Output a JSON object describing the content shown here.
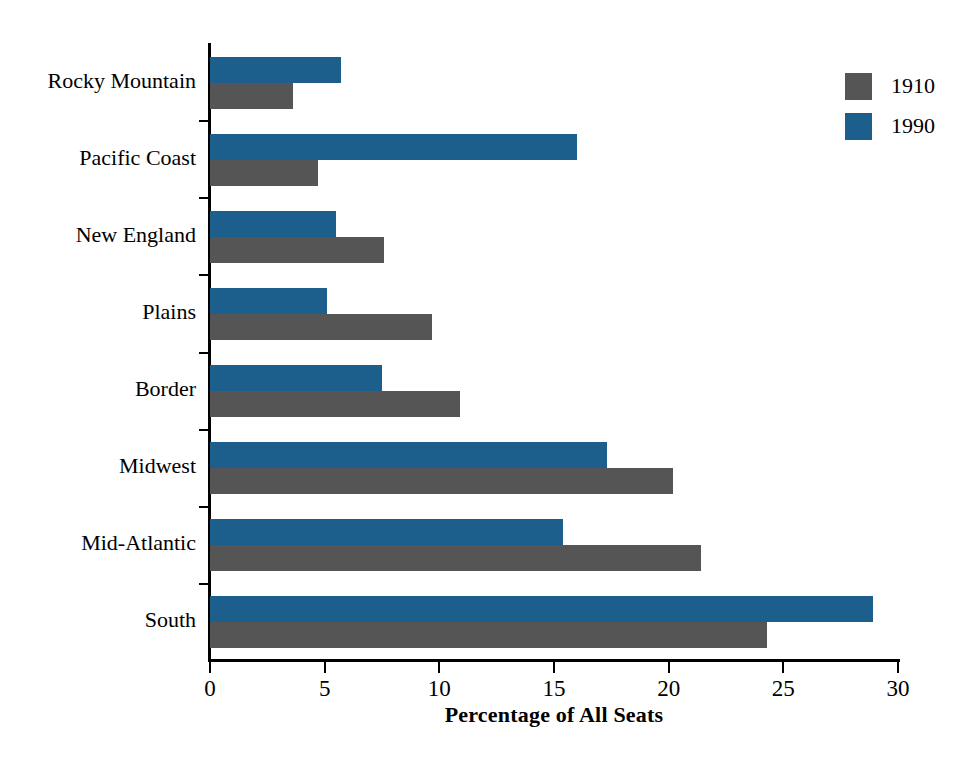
{
  "chart_data": {
    "type": "bar",
    "orientation": "horizontal",
    "title": "",
    "xlabel": "Percentage of All Seats",
    "ylabel": "",
    "xlim": [
      0,
      30
    ],
    "xticks": [
      0,
      5,
      10,
      15,
      20,
      25,
      30
    ],
    "xtick_labels": [
      "0",
      "5",
      "10",
      "15",
      "20",
      "25",
      "30"
    ],
    "grid": false,
    "legend_position": "top-right",
    "categories": [
      "Rocky Mountain",
      "Pacific Coast",
      "New England",
      "Plains",
      "Border",
      "Midwest",
      "Mid-Atlantic",
      "South"
    ],
    "series": [
      {
        "name": "1910",
        "color": "#555555",
        "values": [
          3.6,
          4.7,
          7.6,
          9.7,
          10.9,
          20.2,
          21.4,
          24.3
        ]
      },
      {
        "name": "1990",
        "color": "#1c5f8d",
        "values": [
          5.7,
          16.0,
          5.5,
          5.1,
          7.5,
          17.3,
          15.4,
          28.9
        ]
      }
    ]
  },
  "legend": {
    "items": [
      {
        "label": "1910",
        "color": "#555555"
      },
      {
        "label": "1990",
        "color": "#1c5f8d"
      }
    ]
  },
  "axis": {
    "x_title": "Percentage of All Seats"
  }
}
